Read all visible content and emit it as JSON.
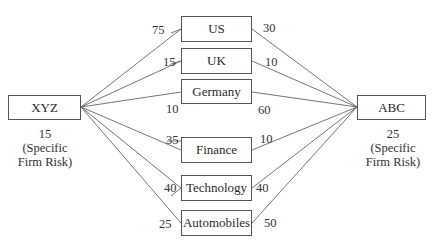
{
  "firms": {
    "left": {
      "name": "XYZ",
      "specific_risk_value": "15",
      "specific_risk_line1": "(Specific",
      "specific_risk_line2": "Firm Risk)"
    },
    "right": {
      "name": "ABC",
      "specific_risk_value": "25",
      "specific_risk_line1": "(Specific",
      "specific_risk_line2": "Firm Risk)"
    }
  },
  "factors": [
    {
      "name": "US",
      "xyz_weight": "75",
      "abc_weight": "30"
    },
    {
      "name": "UK",
      "xyz_weight": "15",
      "abc_weight": "10"
    },
    {
      "name": "Germany",
      "xyz_weight": "10",
      "abc_weight": "60"
    },
    {
      "name": "Finance",
      "xyz_weight": "35",
      "abc_weight": "10"
    },
    {
      "name": "Technology",
      "xyz_weight": "40",
      "abc_weight": "40"
    },
    {
      "name": "Automobiles",
      "xyz_weight": "25",
      "abc_weight": "50"
    }
  ]
}
